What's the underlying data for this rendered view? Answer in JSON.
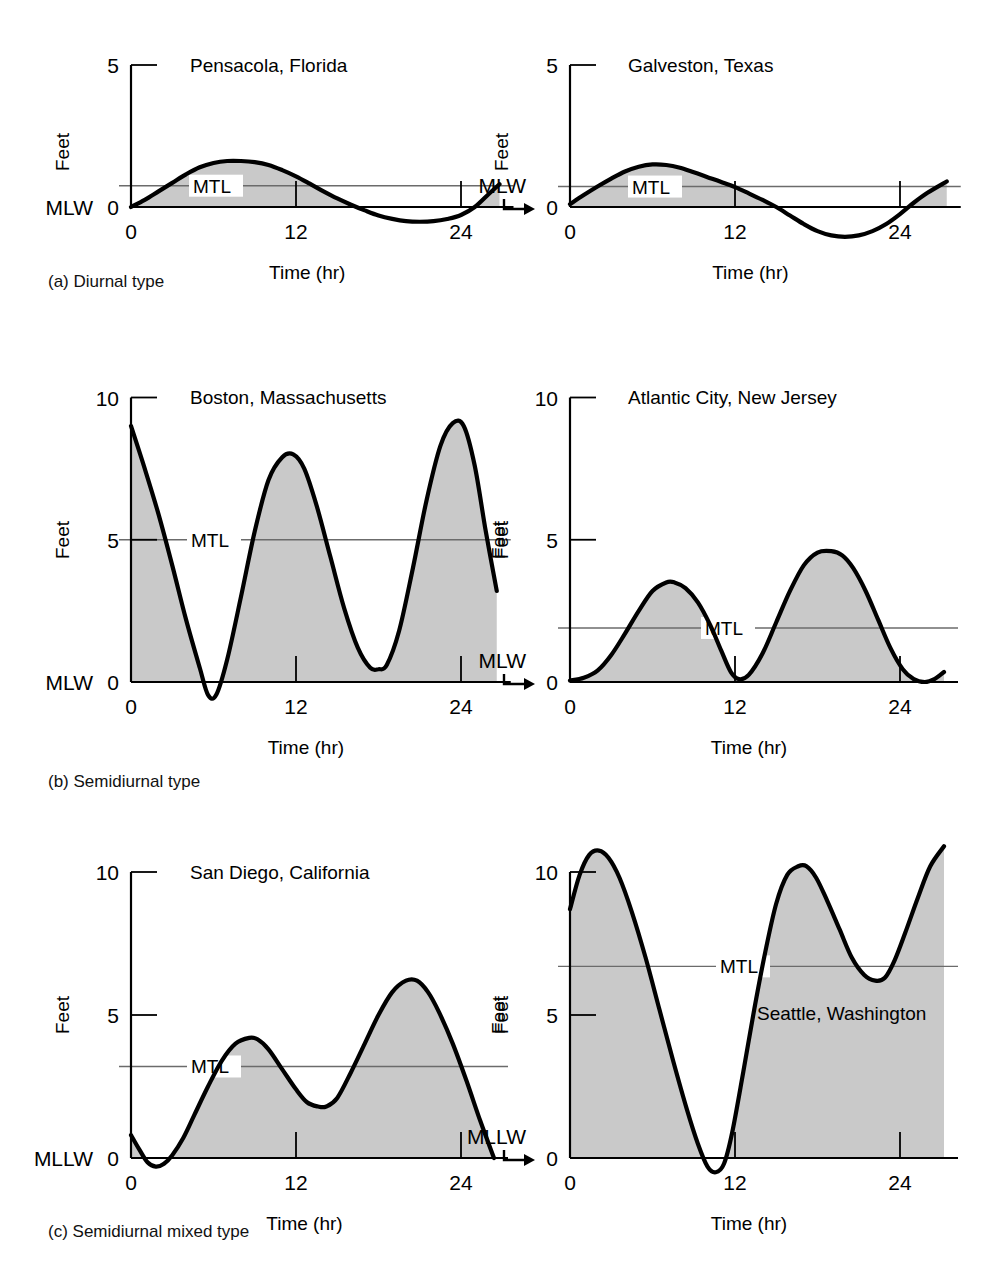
{
  "figure": {
    "kind": "tide-curve-figure",
    "axis_label_x": "Time (hr)",
    "axis_label_y": "Feet",
    "mtl_label": "MTL",
    "group_captions": [
      {
        "id": "a",
        "text": "(a) Diurnal type"
      },
      {
        "id": "b",
        "text": "(b) Semidiurnal type"
      },
      {
        "id": "c",
        "text": "(c) Semidiurnal mixed type"
      }
    ],
    "colors": {
      "curve": "#000000",
      "fill": "#c9c9c9",
      "axis": "#000000",
      "mtl_line": "#6b6b6b",
      "background": "#ffffff"
    }
  },
  "chart_data": [
    {
      "id": "pensacola",
      "type": "line",
      "title": "Pensacola, Florida",
      "xlabel": "Time (hr)",
      "ylabel": "Feet",
      "datum_label": "MLW",
      "datum_arrow": false,
      "mtl_label": "MTL",
      "mtl_value": 0.75,
      "ylim": [
        -1.1,
        5.0
      ],
      "yticks": [
        0,
        5
      ],
      "ytick_labels": [
        "0",
        "5"
      ],
      "xlim": [
        0,
        26.8
      ],
      "xticks": [
        0,
        12,
        24
      ],
      "xtick_labels": [
        "0",
        "12",
        "24"
      ],
      "grid": false,
      "legend": "none",
      "x": [
        0,
        1,
        2,
        3,
        4,
        5,
        6,
        7,
        8,
        9,
        10,
        11,
        12,
        13,
        14,
        15,
        16,
        17,
        18,
        19,
        20,
        21,
        22,
        23,
        24,
        25,
        26,
        26.8
      ],
      "y": [
        0.0,
        0.25,
        0.55,
        0.85,
        1.15,
        1.4,
        1.55,
        1.62,
        1.62,
        1.58,
        1.48,
        1.3,
        1.08,
        0.82,
        0.55,
        0.3,
        0.08,
        -0.12,
        -0.3,
        -0.42,
        -0.5,
        -0.52,
        -0.5,
        -0.42,
        -0.28,
        0.0,
        0.45,
        0.8
      ]
    },
    {
      "id": "galveston",
      "type": "line",
      "title": "Galveston, Texas",
      "xlabel": "Time (hr)",
      "ylabel": "Feet",
      "datum_label": "MLW",
      "datum_arrow": true,
      "mtl_label": "MTL",
      "mtl_value": 0.72,
      "ylim": [
        -1.1,
        5.0
      ],
      "yticks": [
        0,
        5
      ],
      "ytick_labels": [
        "0",
        "5"
      ],
      "xlim": [
        0,
        27.4
      ],
      "xticks": [
        0,
        12,
        24
      ],
      "xtick_labels": [
        "0",
        "12",
        "24"
      ],
      "grid": false,
      "legend": "none",
      "x": [
        0,
        1,
        2,
        3,
        4,
        5,
        6,
        7,
        8,
        9,
        10,
        11,
        12,
        13,
        14,
        15,
        16,
        17,
        18,
        19,
        20,
        21,
        22,
        23,
        24,
        25,
        26,
        27.4
      ],
      "y": [
        0.1,
        0.42,
        0.72,
        1.0,
        1.25,
        1.42,
        1.5,
        1.48,
        1.38,
        1.22,
        1.05,
        0.88,
        0.7,
        0.48,
        0.25,
        0.0,
        -0.3,
        -0.6,
        -0.85,
        -1.0,
        -1.05,
        -1.0,
        -0.85,
        -0.6,
        -0.25,
        0.15,
        0.5,
        0.9
      ]
    },
    {
      "id": "boston",
      "type": "line",
      "title": "Boston, Massachusetts",
      "xlabel": "Time (hr)",
      "ylabel": "Feet",
      "datum_label": "MLW",
      "datum_arrow": false,
      "mtl_label": "MTL",
      "mtl_value": 5.0,
      "ylim": [
        -1.2,
        10.0
      ],
      "yticks": [
        0,
        5,
        10
      ],
      "ytick_labels": [
        "0",
        "5",
        "10"
      ],
      "xlim": [
        0,
        26.6
      ],
      "xticks": [
        0,
        12,
        24
      ],
      "xtick_labels": [
        "0",
        "12",
        "24"
      ],
      "grid": false,
      "legend": "none",
      "x": [
        0,
        1,
        2,
        3,
        4,
        5,
        5.6,
        6.2,
        7,
        8,
        9,
        10,
        11,
        11.8,
        12.6,
        13.5,
        14.5,
        15.5,
        16.5,
        17.4,
        18,
        18.6,
        19.5,
        20.5,
        21.5,
        22.5,
        23.4,
        24.2,
        25,
        25.8,
        26.6
      ],
      "y": [
        9.0,
        7.5,
        5.9,
        4.1,
        2.2,
        0.5,
        -0.45,
        -0.45,
        0.8,
        3.0,
        5.3,
        7.1,
        7.9,
        8.0,
        7.5,
        6.2,
        4.4,
        2.6,
        1.2,
        0.5,
        0.45,
        0.6,
        1.8,
        4.0,
        6.4,
        8.3,
        9.1,
        9.0,
        7.6,
        5.3,
        3.2
      ]
    },
    {
      "id": "atlantic-city",
      "type": "line",
      "title": "Atlantic City, New Jersey",
      "xlabel": "Time (hr)",
      "ylabel": "Feet",
      "datum_label": "MLW",
      "datum_arrow": true,
      "mtl_label": "MTL",
      "mtl_value": 1.9,
      "ylim": [
        -1.2,
        10.0
      ],
      "yticks": [
        0,
        5,
        10
      ],
      "ytick_labels": [
        "0",
        "5",
        "10"
      ],
      "xlim": [
        0,
        27.2
      ],
      "xticks": [
        0,
        12,
        24
      ],
      "xtick_labels": [
        "0",
        "12",
        "24"
      ],
      "grid": false,
      "legend": "none",
      "x": [
        0,
        1,
        2,
        3,
        4,
        5,
        6,
        7,
        7.6,
        8.4,
        9.3,
        10.2,
        11,
        11.7,
        12.3,
        13,
        14,
        15,
        16,
        17,
        18,
        19,
        19.8,
        20.6,
        21.5,
        22.4,
        23.3,
        24.2,
        25,
        25.8,
        26.5,
        27.2
      ],
      "y": [
        0.05,
        0.15,
        0.4,
        0.95,
        1.7,
        2.5,
        3.2,
        3.5,
        3.5,
        3.3,
        2.8,
        2.0,
        1.1,
        0.35,
        0.1,
        0.25,
        1.0,
        2.1,
        3.2,
        4.1,
        4.55,
        4.6,
        4.45,
        4.0,
        3.2,
        2.2,
        1.2,
        0.45,
        0.1,
        0.0,
        0.1,
        0.35
      ]
    },
    {
      "id": "san-diego",
      "type": "line",
      "title": "San Diego, California",
      "xlabel": "Time (hr)",
      "ylabel": "Feet",
      "datum_label": "MLLW",
      "datum_arrow": false,
      "mtl_label": "MTL",
      "mtl_value": 3.2,
      "ylim": [
        -1.2,
        10.0
      ],
      "yticks": [
        0,
        5,
        10
      ],
      "ytick_labels": [
        "0",
        "5",
        "10"
      ],
      "xlim": [
        0,
        26.4
      ],
      "xticks": [
        0,
        12,
        24
      ],
      "xtick_labels": [
        "0",
        "12",
        "24"
      ],
      "grid": false,
      "legend": "none",
      "x": [
        0,
        0.6,
        1.2,
        1.8,
        2.4,
        3,
        3.8,
        4.6,
        5.6,
        6.6,
        7.6,
        8.6,
        9.2,
        10,
        11,
        12,
        12.8,
        13.6,
        14.2,
        15,
        16,
        17,
        18,
        19,
        20,
        20.8,
        21.6,
        22.4,
        23.4,
        24.4,
        25.4,
        26.4
      ],
      "y": [
        0.8,
        0.3,
        -0.15,
        -0.3,
        -0.2,
        0.1,
        0.7,
        1.5,
        2.5,
        3.4,
        4.0,
        4.2,
        4.15,
        3.8,
        3.1,
        2.4,
        1.95,
        1.8,
        1.8,
        2.1,
        3.0,
        4.0,
        5.0,
        5.8,
        6.2,
        6.2,
        5.8,
        5.1,
        4.0,
        2.7,
        1.3,
        0.0
      ]
    },
    {
      "id": "seattle",
      "type": "line",
      "title": "Seattle, Washington",
      "xlabel": "Time (hr)",
      "ylabel": "Feet",
      "datum_label": "MLLW",
      "datum_arrow": true,
      "mtl_label": "MTL",
      "mtl_value": 6.7,
      "ylim": [
        -1.2,
        11.3
      ],
      "yticks": [
        0,
        5,
        10
      ],
      "ytick_labels": [
        "0",
        "5",
        "10"
      ],
      "xlim": [
        0,
        27.2
      ],
      "xticks": [
        0,
        12,
        24
      ],
      "xtick_labels": [
        "0",
        "12",
        "24"
      ],
      "grid": false,
      "legend": "none",
      "x": [
        0,
        0.7,
        1.4,
        2.1,
        2.8,
        3.6,
        4.5,
        5.5,
        6.5,
        7.5,
        8.5,
        9.3,
        10,
        10.6,
        11.2,
        11.8,
        12.6,
        13.4,
        14.2,
        15,
        15.8,
        16.6,
        17.2,
        17.9,
        18.7,
        19.6,
        20.5,
        21.4,
        22.2,
        22.9,
        23.6,
        24.4,
        25.3,
        26.2,
        27.2
      ],
      "y": [
        8.7,
        9.9,
        10.6,
        10.75,
        10.5,
        9.8,
        8.6,
        7.0,
        5.2,
        3.4,
        1.7,
        0.5,
        -0.3,
        -0.5,
        -0.2,
        0.9,
        3.0,
        5.2,
        7.2,
        8.9,
        9.9,
        10.2,
        10.2,
        9.8,
        9.0,
        8.0,
        7.0,
        6.4,
        6.2,
        6.3,
        6.9,
        7.9,
        9.1,
        10.2,
        10.9
      ]
    }
  ]
}
